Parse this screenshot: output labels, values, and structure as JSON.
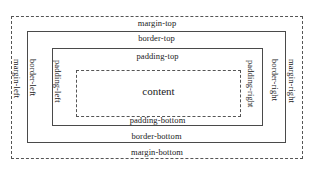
{
  "diagram": {
    "colors": {
      "background": "#ffffff",
      "stroke_solid": "#4a4a4a",
      "stroke_dashed": "#555555",
      "text": "#1a1a1a"
    },
    "boxes": {
      "margin": {
        "name": "margin-box",
        "style": "dashed"
      },
      "border": {
        "name": "border-box",
        "style": "solid"
      },
      "padding": {
        "name": "padding-box",
        "style": "solid"
      },
      "content": {
        "name": "content-box",
        "style": "dashed"
      }
    },
    "labels": {
      "margin_top": "margin-top",
      "margin_bottom": "margin-bottom",
      "margin_left": "margin-left",
      "margin_right": "margin-right",
      "border_top": "border-top",
      "border_bottom": "border-bottom",
      "border_left": "border-left",
      "border_right": "border-right",
      "padding_top": "padding-top",
      "padding_bottom": "padding-bottom",
      "padding_left": "padding-left",
      "padding_right": "padding-right",
      "content": "content"
    }
  }
}
